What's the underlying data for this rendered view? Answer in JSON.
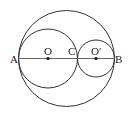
{
  "diagram": {
    "labels": {
      "A": "A",
      "O": "O",
      "C": "C",
      "O_prime": "O′",
      "B": "B"
    },
    "colors": {
      "stroke": "#333333",
      "background": "#ffffff"
    }
  }
}
